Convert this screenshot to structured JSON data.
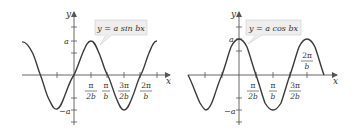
{
  "graphs": [
    {
      "id": "sine",
      "equation_label": "y = a sin bx",
      "y_axis_label": "y",
      "x_axis_label": "x",
      "y_tick_labels": {
        "top": "a",
        "bottom": "−a"
      },
      "x_tick_labels": [
        {
          "num": "π",
          "den": "2b"
        },
        {
          "num": "π",
          "den": "b"
        },
        {
          "num": "3π",
          "den": "2b"
        },
        {
          "num": "2π",
          "den": "b"
        }
      ]
    },
    {
      "id": "cosine",
      "equation_label": "y = a cos bx",
      "y_axis_label": "y",
      "x_axis_label": "x",
      "y_tick_labels": {
        "top": "a",
        "bottom": "−a"
      },
      "x_tick_labels": [
        {
          "num": "π",
          "den": "2b"
        },
        {
          "num": "π",
          "den": "b"
        },
        {
          "num": "3π",
          "den": "2b"
        },
        {
          "num": "2π",
          "den": "b"
        }
      ]
    }
  ],
  "colors": {
    "curve": "#3a3a3a",
    "axis": "#555555",
    "label_box_bg": "#eeeeee",
    "label_box_border": "#cccccc",
    "text": "#333333"
  }
}
